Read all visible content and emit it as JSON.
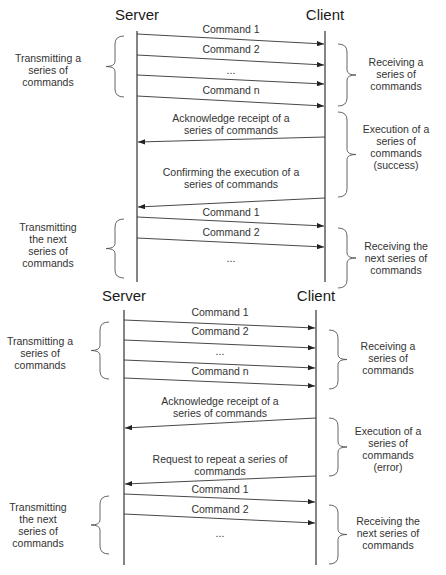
{
  "diagrams": [
    {
      "id": "success",
      "server_label": "Server",
      "client_label": "Client",
      "messages": [
        {
          "label": [
            "Command 1"
          ],
          "direction": "server-to-client"
        },
        {
          "label": [
            "Command 2"
          ],
          "direction": "server-to-client"
        },
        {
          "label": [
            "..."
          ],
          "direction": "server-to-client"
        },
        {
          "label": [
            "Command n"
          ],
          "direction": "server-to-client"
        },
        {
          "label": [
            "Acknowledge receipt of a",
            "series of commands"
          ],
          "direction": "client-to-server"
        },
        {
          "label": [
            "Confirming the execution of a",
            "series of commands"
          ],
          "direction": "client-to-server"
        },
        {
          "label": [
            "Command 1"
          ],
          "direction": "server-to-client"
        },
        {
          "label": [
            "Command 2"
          ],
          "direction": "server-to-client"
        },
        {
          "label": [
            "..."
          ],
          "direction": "none"
        }
      ],
      "left_annotations": [
        {
          "text": [
            "Transmitting a",
            "series of",
            "commands"
          ]
        },
        {
          "text": [
            "Transmitting",
            "the next",
            "series of",
            "commands"
          ]
        }
      ],
      "right_annotations": [
        {
          "text": [
            "Receiving a",
            "series of",
            "commands"
          ]
        },
        {
          "text": [
            "Execution of a",
            "series of",
            "commands",
            "(success)"
          ]
        },
        {
          "text": [
            "Receiving the",
            "next series of",
            "commands"
          ]
        }
      ]
    },
    {
      "id": "error",
      "server_label": "Server",
      "client_label": "Client",
      "messages": [
        {
          "label": [
            "Command 1"
          ],
          "direction": "server-to-client"
        },
        {
          "label": [
            "Command 2"
          ],
          "direction": "server-to-client"
        },
        {
          "label": [
            "..."
          ],
          "direction": "server-to-client"
        },
        {
          "label": [
            "Command n"
          ],
          "direction": "server-to-client"
        },
        {
          "label": [
            "Acknowledge receipt of a",
            "series of commands"
          ],
          "direction": "client-to-server"
        },
        {
          "label": [
            "Request to repeat a series of",
            "commands"
          ],
          "direction": "client-to-server"
        },
        {
          "label": [
            "Command 1"
          ],
          "direction": "server-to-client"
        },
        {
          "label": [
            "Command 2"
          ],
          "direction": "server-to-client"
        },
        {
          "label": [
            "..."
          ],
          "direction": "none"
        }
      ],
      "left_annotations": [
        {
          "text": [
            "Transmitting a",
            "series of",
            "commands"
          ]
        },
        {
          "text": [
            "Transmitting",
            "the next",
            "series of",
            "commands"
          ]
        }
      ],
      "right_annotations": [
        {
          "text": [
            "Receiving a",
            "series of",
            "commands"
          ]
        },
        {
          "text": [
            "Execution of a",
            "series of",
            "commands",
            "(error)"
          ]
        },
        {
          "text": [
            "Receiving the",
            "next series of",
            "commands"
          ]
        }
      ]
    }
  ]
}
